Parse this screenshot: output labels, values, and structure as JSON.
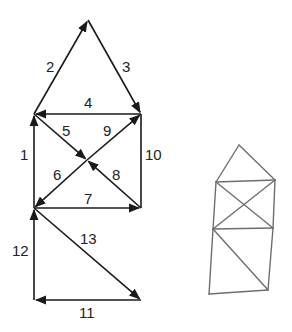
{
  "diagram": {
    "colors": {
      "line": "#1a1a1a",
      "sketch": "#6e6e6e",
      "background": "#ffffff"
    },
    "vertices": {
      "apex": [
        88,
        20
      ],
      "upper_left": [
        34,
        114
      ],
      "upper_right": [
        141,
        114
      ],
      "center": [
        87,
        160
      ],
      "mid_left": [
        34,
        208
      ],
      "mid_right": [
        141,
        208
      ],
      "bottom_left": [
        34,
        300
      ],
      "bottom_right": [
        141,
        300
      ]
    },
    "edges": [
      {
        "label": "1",
        "from": "mid_left",
        "to": "upper_left",
        "lx": 20,
        "ly": 160
      },
      {
        "label": "2",
        "from": "upper_left",
        "to": "apex",
        "lx": 46,
        "ly": 72
      },
      {
        "label": "3",
        "from": "apex",
        "to": "upper_right",
        "lx": 122,
        "ly": 72
      },
      {
        "label": "4",
        "from": "upper_right",
        "to": "upper_left",
        "lx": 84,
        "ly": 108
      },
      {
        "label": "5",
        "from": "upper_left",
        "to": "center",
        "lx": 62,
        "ly": 136
      },
      {
        "label": "6",
        "from": "center",
        "to": "mid_left",
        "lx": 53,
        "ly": 180
      },
      {
        "label": "7",
        "from": "mid_left",
        "to": "mid_right",
        "lx": 84,
        "ly": 204
      },
      {
        "label": "8",
        "from": "mid_right",
        "to": "center",
        "lx": 112,
        "ly": 180
      },
      {
        "label": "9",
        "from": "center",
        "to": "upper_right",
        "lx": 103,
        "ly": 136
      },
      {
        "label": "10",
        "from": "upper_right",
        "to": "mid_right",
        "lx": 145,
        "ly": 160,
        "no_arrow": true
      },
      {
        "label": "11",
        "from": "bottom_right",
        "to": "bottom_left",
        "lx": 79,
        "ly": 318
      },
      {
        "label": "12",
        "from": "bottom_left",
        "to": "mid_left",
        "lx": 12,
        "ly": 256
      },
      {
        "label": "13",
        "from": "mid_left",
        "to": "bottom_right",
        "lx": 80,
        "ly": 244
      }
    ],
    "sketch_points": {
      "apex": [
        239,
        145
      ],
      "upper_left": [
        216,
        182
      ],
      "upper_right": [
        275,
        180
      ],
      "center": [
        240,
        206
      ],
      "mid_left": [
        213,
        229
      ],
      "mid_right": [
        273,
        228
      ],
      "bottom_left": [
        209,
        294
      ],
      "bottom_right": [
        268,
        290
      ]
    }
  }
}
